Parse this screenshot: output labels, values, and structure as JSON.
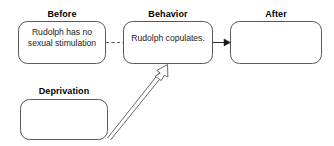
{
  "diagram": {
    "type": "three-term-contingency-flow",
    "nodes": [
      {
        "id": "before",
        "label": "Before",
        "text": "Rudolph has no sexual stimulation",
        "text_lines": [
          "Rudolph has",
          "no sexual",
          "stimulation"
        ],
        "empty": false
      },
      {
        "id": "behavior",
        "label": "Behavior",
        "text": "Rudolph copulates.",
        "text_lines": [
          "Rudolph",
          "copulates."
        ],
        "empty": false
      },
      {
        "id": "after",
        "label": "After",
        "text": "",
        "text_lines": [],
        "empty": true
      },
      {
        "id": "deprivation",
        "label": "Deprivation",
        "text": "",
        "text_lines": [],
        "empty": true
      }
    ],
    "connectors": [
      {
        "id": "before-to-behavior",
        "from": "before",
        "to": "behavior",
        "style": "dashed",
        "arrowhead": "none"
      },
      {
        "id": "behavior-to-after",
        "from": "behavior",
        "to": "after",
        "style": "solid",
        "arrowhead": "filled"
      },
      {
        "id": "deprivation-to-behavior",
        "from": "deprivation",
        "to": "behavior",
        "style": "solid-double-line",
        "arrowhead": "hollow"
      }
    ],
    "colors": {
      "stroke": "#4d4d4d",
      "text": "#1a1a1a",
      "label": "#000000",
      "background": "#ffffff",
      "arrow_fill": "#ffffff"
    }
  }
}
